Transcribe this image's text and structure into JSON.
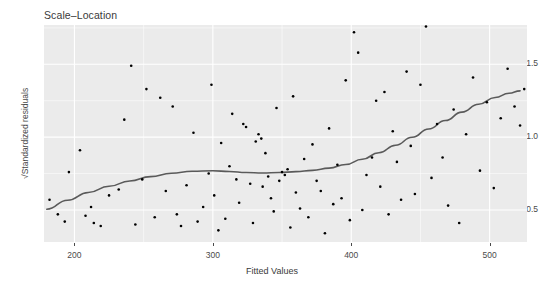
{
  "chart_data": {
    "type": "scatter",
    "title": "Scale–Location",
    "xlabel": "Fitted Values",
    "ylabel": "√Standardized residuals",
    "xlim": [
      178,
      527
    ],
    "ylim": [
      0.28,
      1.77
    ],
    "xticks": [
      200,
      300,
      400,
      500
    ],
    "xticklabels": [
      "200",
      "300",
      "400",
      "500"
    ],
    "yticks": [
      0.5,
      1.0,
      1.5
    ],
    "yticklabels": [
      "0.5",
      "1.0",
      "1.5"
    ],
    "grid": true,
    "legend": "none",
    "panel_background": "#ebebeb",
    "grid_color": "#ffffff",
    "point_color": "#000000",
    "point_size": 2.6,
    "smooth_color": "#5a5a5a",
    "smooth_width": 1.6,
    "points": [
      [
        182,
        0.57
      ],
      [
        188,
        0.47
      ],
      [
        193,
        0.42
      ],
      [
        196,
        0.76
      ],
      [
        204,
        0.91
      ],
      [
        208,
        0.46
      ],
      [
        212,
        0.52
      ],
      [
        214,
        0.41
      ],
      [
        219,
        0.39
      ],
      [
        225,
        0.6
      ],
      [
        232,
        0.64
      ],
      [
        236,
        1.12
      ],
      [
        241,
        1.49
      ],
      [
        244,
        0.4
      ],
      [
        249,
        0.71
      ],
      [
        252,
        1.33
      ],
      [
        258,
        0.45
      ],
      [
        262,
        1.27
      ],
      [
        266,
        0.63
      ],
      [
        271,
        1.21
      ],
      [
        274,
        0.47
      ],
      [
        277,
        0.39
      ],
      [
        281,
        0.67
      ],
      [
        286,
        1.03
      ],
      [
        289,
        0.42
      ],
      [
        293,
        0.52
      ],
      [
        297,
        0.75
      ],
      [
        299,
        1.36
      ],
      [
        301,
        0.6
      ],
      [
        304,
        0.36
      ],
      [
        306,
        0.96
      ],
      [
        309,
        0.44
      ],
      [
        312,
        0.8
      ],
      [
        314,
        1.16
      ],
      [
        317,
        0.71
      ],
      [
        319,
        0.55
      ],
      [
        322,
        1.09
      ],
      [
        324,
        1.07
      ],
      [
        327,
        0.68
      ],
      [
        329,
        0.41
      ],
      [
        331,
        0.97
      ],
      [
        333,
        1.02
      ],
      [
        335,
        0.99
      ],
      [
        336,
        0.66
      ],
      [
        338,
        0.89
      ],
      [
        340,
        0.73
      ],
      [
        342,
        0.58
      ],
      [
        344,
        0.49
      ],
      [
        346,
        1.2
      ],
      [
        348,
        0.7
      ],
      [
        350,
        0.76
      ],
      [
        352,
        0.74
      ],
      [
        354,
        0.78
      ],
      [
        356,
        0.38
      ],
      [
        358,
        1.28
      ],
      [
        360,
        0.62
      ],
      [
        363,
        0.51
      ],
      [
        366,
        0.85
      ],
      [
        369,
        0.45
      ],
      [
        372,
        0.95
      ],
      [
        375,
        0.7
      ],
      [
        378,
        0.63
      ],
      [
        381,
        0.34
      ],
      [
        384,
        1.06
      ],
      [
        387,
        0.54
      ],
      [
        390,
        0.81
      ],
      [
        393,
        0.58
      ],
      [
        396,
        1.39
      ],
      [
        399,
        0.43
      ],
      [
        402,
        1.72
      ],
      [
        405,
        1.58
      ],
      [
        408,
        0.5
      ],
      [
        411,
        0.74
      ],
      [
        415,
        0.86
      ],
      [
        418,
        1.25
      ],
      [
        421,
        0.66
      ],
      [
        424,
        1.31
      ],
      [
        427,
        0.47
      ],
      [
        430,
        1.04
      ],
      [
        433,
        0.83
      ],
      [
        436,
        0.57
      ],
      [
        440,
        1.45
      ],
      [
        443,
        0.94
      ],
      [
        446,
        0.61
      ],
      [
        450,
        1.36
      ],
      [
        454,
        1.76
      ],
      [
        458,
        0.72
      ],
      [
        462,
        1.09
      ],
      [
        466,
        0.86
      ],
      [
        470,
        0.53
      ],
      [
        474,
        1.19
      ],
      [
        478,
        0.41
      ],
      [
        483,
        1.02
      ],
      [
        488,
        1.41
      ],
      [
        493,
        0.77
      ],
      [
        498,
        1.24
      ],
      [
        503,
        0.65
      ],
      [
        508,
        1.13
      ],
      [
        513,
        1.47
      ],
      [
        518,
        1.21
      ],
      [
        522,
        1.08
      ],
      [
        525,
        1.33
      ]
    ],
    "smooth_curve": [
      [
        180,
        0.505
      ],
      [
        195,
        0.567
      ],
      [
        210,
        0.62
      ],
      [
        225,
        0.663
      ],
      [
        240,
        0.699
      ],
      [
        255,
        0.729
      ],
      [
        270,
        0.752
      ],
      [
        285,
        0.766
      ],
      [
        300,
        0.769
      ],
      [
        312,
        0.764
      ],
      [
        324,
        0.757
      ],
      [
        336,
        0.754
      ],
      [
        348,
        0.757
      ],
      [
        360,
        0.763
      ],
      [
        372,
        0.772
      ],
      [
        384,
        0.787
      ],
      [
        396,
        0.812
      ],
      [
        408,
        0.848
      ],
      [
        420,
        0.893
      ],
      [
        432,
        0.944
      ],
      [
        444,
        0.999
      ],
      [
        456,
        1.056
      ],
      [
        468,
        1.114
      ],
      [
        480,
        1.172
      ],
      [
        492,
        1.226
      ],
      [
        504,
        1.272
      ],
      [
        514,
        1.301
      ],
      [
        522,
        1.318
      ]
    ]
  },
  "axis": {
    "y_tick_0": "0.5",
    "y_tick_1": "1.0",
    "y_tick_2": "1.5",
    "x_tick_0": "200",
    "x_tick_1": "300",
    "x_tick_2": "400",
    "x_tick_3": "500"
  }
}
